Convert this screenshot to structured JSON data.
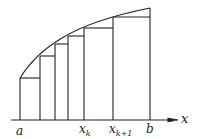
{
  "figure": {
    "colors": {
      "stroke": "#222222",
      "background": "#ffffff"
    },
    "axis": {
      "label": "x"
    },
    "labels": {
      "a": "a",
      "xk_base": "x",
      "xk_sub": "k",
      "xk1_base": "x",
      "xk1_sub": "k+1",
      "b": "b"
    },
    "partition_points": [
      "a",
      "",
      "",
      "",
      "x_k",
      "x_{k+1}",
      "b"
    ]
  }
}
